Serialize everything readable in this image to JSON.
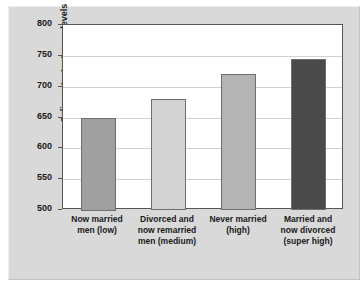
{
  "chart_data": {
    "type": "bar",
    "title": "",
    "subtitle": "",
    "xlabel": "",
    "ylabel": "Salivary testosterone levels",
    "ylim": [
      500,
      800
    ],
    "yticks": [
      500,
      550,
      600,
      650,
      700,
      750,
      800
    ],
    "ytick_labels": [
      "500",
      "550",
      "600",
      "650",
      "700",
      "750",
      "800"
    ],
    "grid": true,
    "legend": "none",
    "categories": [
      "Now married\nmen (low)",
      "Divorced and\nnow remarried\nmen (medium)",
      "Never married\n(high)",
      "Married and\nnow divorced\n(super high)"
    ],
    "values": [
      650,
      680,
      720,
      745
    ],
    "bar_colors": [
      "#a0a0a0",
      "#d2d2d2",
      "#b4b4b4",
      "#4a4a4a"
    ]
  },
  "axis": {
    "y_label": "Salivary testosterone levels",
    "y_ticks": [
      {
        "value": 800,
        "label": "800"
      },
      {
        "value": 750,
        "label": "750"
      },
      {
        "value": 700,
        "label": "700"
      },
      {
        "value": 650,
        "label": "650"
      },
      {
        "value": 600,
        "label": "600"
      },
      {
        "value": 550,
        "label": "550"
      },
      {
        "value": 500,
        "label": "500"
      }
    ]
  },
  "bars": [
    {
      "value": 650,
      "color": "#a0a0a0",
      "label_line1": "Now married",
      "label_line2": "men (low)",
      "label_line3": ""
    },
    {
      "value": 680,
      "color": "#d2d2d2",
      "label_line1": "Divorced and",
      "label_line2": "now remarried",
      "label_line3": "men (medium)"
    },
    {
      "value": 720,
      "color": "#b4b4b4",
      "label_line1": "Never married",
      "label_line2": "(high)",
      "label_line3": ""
    },
    {
      "value": 745,
      "color": "#4a4a4a",
      "label_line1": "Married and",
      "label_line2": "now divorced",
      "label_line3": "(super high)"
    }
  ]
}
